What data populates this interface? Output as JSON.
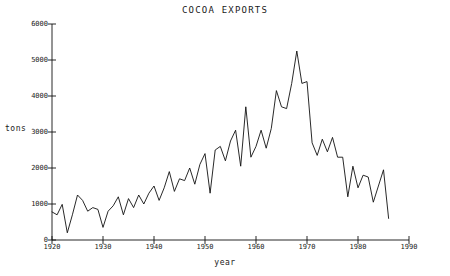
{
  "chart_data": {
    "type": "line",
    "title": "COCOA EXPORTS",
    "xlabel": "year",
    "ylabel": "tons",
    "xlim": [
      1920,
      1990
    ],
    "ylim": [
      0,
      6000
    ],
    "xticks": [
      1920,
      1930,
      1940,
      1950,
      1960,
      1970,
      1980,
      1990
    ],
    "xticklabels": [
      "1920",
      "1930",
      "1940",
      "1950",
      "1960",
      "1970",
      "1980",
      "1990"
    ],
    "yticks": [
      0,
      1000,
      2000,
      3000,
      4000,
      5000,
      6000
    ],
    "yticklabels": [
      "0",
      "1000",
      "2000",
      "3000",
      "4000",
      "5000",
      "6000"
    ],
    "grid": false,
    "legend": false,
    "series": [
      {
        "name": "cocoa exports",
        "x": [
          1920,
          1921,
          1922,
          1923,
          1924,
          1925,
          1926,
          1927,
          1928,
          1929,
          1930,
          1931,
          1932,
          1933,
          1934,
          1935,
          1936,
          1937,
          1938,
          1939,
          1940,
          1941,
          1942,
          1943,
          1944,
          1945,
          1946,
          1947,
          1948,
          1949,
          1950,
          1951,
          1952,
          1953,
          1954,
          1955,
          1956,
          1957,
          1958,
          1959,
          1960,
          1961,
          1962,
          1963,
          1964,
          1965,
          1966,
          1967,
          1968,
          1969,
          1970,
          1971,
          1972,
          1973,
          1974,
          1975,
          1976,
          1977,
          1978,
          1979,
          1980,
          1981,
          1982,
          1983,
          1984,
          1985,
          1986
        ],
        "values": [
          780,
          700,
          990,
          200,
          700,
          1250,
          1100,
          800,
          900,
          850,
          350,
          800,
          950,
          1200,
          700,
          1150,
          900,
          1250,
          1000,
          1300,
          1500,
          1100,
          1450,
          1900,
          1350,
          1700,
          1650,
          2000,
          1550,
          2100,
          2400,
          1300,
          2500,
          2600,
          2200,
          2750,
          3050,
          2050,
          3700,
          2300,
          2600,
          3050,
          2550,
          3100,
          4150,
          3700,
          3650,
          4350,
          5250,
          4350,
          4400,
          2700,
          2350,
          2800,
          2450,
          2850,
          2300,
          2300,
          1200,
          2050,
          1450,
          1800,
          1750,
          1050,
          1500,
          1950,
          600
        ]
      }
    ]
  }
}
